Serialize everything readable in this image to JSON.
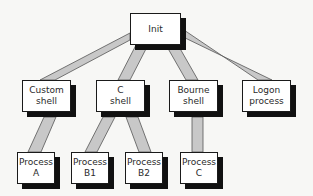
{
  "diagram": {
    "type": "process-tree",
    "colors": {
      "background": "#f7f7f5",
      "node_fill": "#ffffff",
      "node_border": "#1a1a1a",
      "node_shadow": "#111111",
      "link_fill": "#c8c8c8",
      "link_stroke": "#555555"
    },
    "nodes": {
      "init": {
        "label": "Init"
      },
      "custom_shell": {
        "label": "Custom\nshell"
      },
      "c_shell": {
        "label": "C\nshell"
      },
      "bourne_shell": {
        "label": "Bourne\nshell"
      },
      "logon_process": {
        "label": "Logon\nprocess"
      },
      "process_a": {
        "label": "Process\nA"
      },
      "process_b1": {
        "label": "Process\nB1"
      },
      "process_b2": {
        "label": "Process\nB2"
      },
      "process_c": {
        "label": "Process\nC"
      }
    },
    "edges": [
      {
        "from": "Init",
        "to": "Custom shell"
      },
      {
        "from": "Init",
        "to": "C shell"
      },
      {
        "from": "Init",
        "to": "Bourne shell"
      },
      {
        "from": "Init",
        "to": "Logon process"
      },
      {
        "from": "Custom shell",
        "to": "Process A"
      },
      {
        "from": "C shell",
        "to": "Process B1"
      },
      {
        "from": "C shell",
        "to": "Process B2"
      },
      {
        "from": "Bourne shell",
        "to": "Process C"
      }
    ]
  }
}
